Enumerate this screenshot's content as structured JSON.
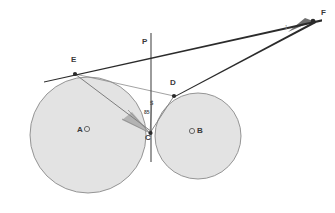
{
  "figure": {
    "background_color": "#ffffff",
    "width": 335,
    "height": 213
  },
  "style": {
    "circle_fill": "#e3e3e3",
    "circle_stroke": "#8a8a8a",
    "line_color": "#4a4a4a",
    "heavy_line_color": "#2b2b2b",
    "point_color": "#2b2b2b",
    "label_color": "#3a3a3a",
    "shade_fill": "#9a9a9a"
  },
  "circles": [
    {
      "name": "circle-a",
      "center_label": "A",
      "center_marker": "O",
      "cx": 88,
      "cy": 135,
      "r": 58,
      "label_x": 78,
      "label_y": 131
    },
    {
      "name": "circle-b",
      "center_label": "B",
      "center_marker": "O",
      "cx": 198,
      "cy": 136,
      "r": 43,
      "label_x": 191,
      "label_y": 132
    }
  ],
  "points": [
    {
      "id": "E",
      "label": "E",
      "x": 75,
      "y": 74,
      "label_x": 71,
      "label_y": 60,
      "marked": true
    },
    {
      "id": "P",
      "label": "P",
      "x": 148,
      "y": 53,
      "label_x": 142,
      "label_y": 42,
      "marked": false
    },
    {
      "id": "D",
      "label": "D",
      "x": 174,
      "y": 96,
      "label_x": 170,
      "label_y": 83,
      "marked": true
    },
    {
      "id": "C",
      "label": "C",
      "x": 150,
      "y": 133,
      "label_x": 145,
      "label_y": 136,
      "marked": true
    },
    {
      "id": "F",
      "label": "F",
      "x": 313,
      "y": 21,
      "label_x": 320,
      "label_y": 13,
      "marked": true
    },
    {
      "id": "S",
      "label": "S",
      "x": 151,
      "y": 106,
      "label_x": 150,
      "label_y": 103,
      "marked": false
    }
  ],
  "angle_labels": [
    {
      "id": "angle-at-c",
      "text": "85",
      "x": 145,
      "y": 114
    },
    {
      "id": "angle-at-f",
      "text": "1",
      "x": 285,
      "y": 29
    }
  ],
  "segments": [
    {
      "name": "tangent-line-e-f",
      "x1": 44,
      "y1": 81,
      "x2": 322,
      "y2": 20,
      "weight": "heavy"
    },
    {
      "name": "segment-d-f",
      "x1": 174,
      "y1": 96,
      "x2": 316,
      "y2": 22,
      "weight": "heavy"
    },
    {
      "name": "vertical-line-p-c",
      "x1": 151,
      "y1": 33,
      "x2": 151,
      "y2": 162,
      "weight": "medium"
    },
    {
      "name": "chord-e-c",
      "x1": 75,
      "y1": 74,
      "x2": 152,
      "y2": 132,
      "weight": "light"
    },
    {
      "name": "chord-e-d",
      "x1": 75,
      "y1": 74,
      "x2": 174,
      "y2": 96,
      "weight": "light"
    },
    {
      "name": "chord-c-d",
      "x1": 150,
      "y1": 133,
      "x2": 174,
      "y2": 96,
      "weight": "light"
    },
    {
      "name": "ray-c-to-upper",
      "x1": 150,
      "y1": 133,
      "x2": 152,
      "y2": 100,
      "weight": "light"
    },
    {
      "name": "ray-c-left-lower",
      "x1": 150,
      "y1": 133,
      "x2": 128,
      "y2": 110,
      "weight": "light"
    },
    {
      "name": "ray-c-left-flat",
      "x1": 150,
      "y1": 133,
      "x2": 122,
      "y2": 119,
      "weight": "light"
    }
  ],
  "shaded_regions": [
    {
      "name": "shaded-wedge-at-c",
      "points": "150,133 132,112 122,120"
    },
    {
      "name": "shaded-wedge-at-f",
      "points": "313,21 288,32 305,18"
    }
  ]
}
